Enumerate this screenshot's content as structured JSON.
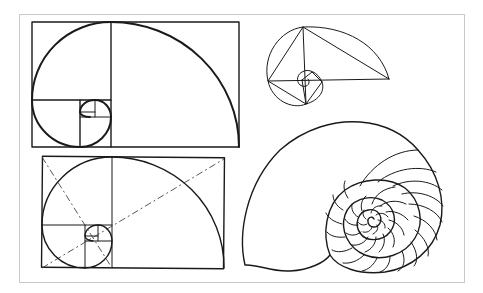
{
  "figure": {
    "description": "Golden ratio spirals and nautilus shell illustration",
    "colors": {
      "background": "#ffffff",
      "ink": "#1a1a1a",
      "frame": "#c9c9c9"
    },
    "panels": [
      {
        "id": "golden-rectangle-spiral",
        "label": "Golden rectangle with Fibonacci spiral"
      },
      {
        "id": "golden-triangle-spiral",
        "label": "Golden triangle spiral"
      },
      {
        "id": "golden-rectangle-diagonals",
        "label": "Golden rectangle spiral with diagonals"
      },
      {
        "id": "nautilus-shell",
        "label": "Nautilus shell cross-section"
      }
    ]
  }
}
